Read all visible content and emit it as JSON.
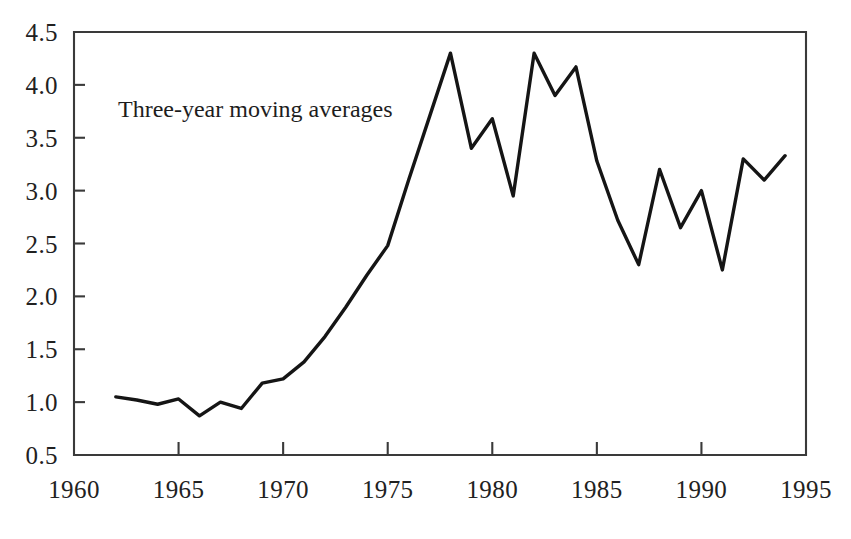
{
  "chart_data": {
    "type": "line",
    "title": "",
    "subtitle": "",
    "annotation": "Three-year moving averages",
    "xlabel": "",
    "ylabel": "",
    "xlim": [
      1960,
      1995
    ],
    "ylim": [
      0.5,
      4.5
    ],
    "grid": false,
    "legend": null,
    "x_ticks": [
      1960,
      1965,
      1970,
      1975,
      1980,
      1985,
      1990,
      1995
    ],
    "x_tick_labels": [
      "1960",
      "1965",
      "1970",
      "1975",
      "1980",
      "1985",
      "1990",
      "1995"
    ],
    "y_ticks": [
      0.5,
      1.0,
      1.5,
      2.0,
      2.5,
      3.0,
      3.5,
      4.0,
      4.5
    ],
    "y_tick_labels": [
      "0.5",
      "1.0",
      "1.5",
      "2.0",
      "2.5",
      "3.0",
      "3.5",
      "4.0",
      "4.5"
    ],
    "series": [
      {
        "name": "Three-year moving averages",
        "color": "#151515",
        "x": [
          1962,
          1963,
          1964,
          1965,
          1966,
          1967,
          1968,
          1969,
          1970,
          1971,
          1972,
          1973,
          1974,
          1975,
          1976,
          1977,
          1978,
          1979,
          1980,
          1981,
          1982,
          1983,
          1984,
          1985,
          1986,
          1987,
          1988,
          1989,
          1990,
          1991,
          1992,
          1993,
          1994
        ],
        "values": [
          1.05,
          1.02,
          0.98,
          1.03,
          0.87,
          1.0,
          0.94,
          1.18,
          1.22,
          1.38,
          1.62,
          1.9,
          2.2,
          2.48,
          3.1,
          3.7,
          4.3,
          3.4,
          3.68,
          2.95,
          4.3,
          3.9,
          4.17,
          3.28,
          2.72,
          2.3,
          3.2,
          2.65,
          3.0,
          2.25,
          3.3,
          3.1,
          3.33
        ]
      }
    ]
  },
  "axes": {
    "annotation_label": "Three-year moving averages"
  }
}
